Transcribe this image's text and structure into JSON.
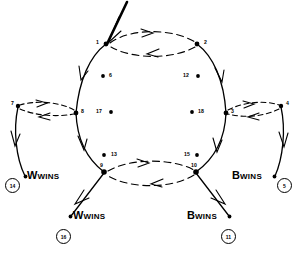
{
  "diagram": {
    "stroke_color": "#000000",
    "background": "#ffffff",
    "main_cycle_nodes": [
      {
        "id": "1",
        "label": "1",
        "x": 106,
        "y": 44
      },
      {
        "id": "2",
        "label": "2",
        "x": 197,
        "y": 44
      },
      {
        "id": "3",
        "label": "3",
        "x": 226,
        "y": 113
      },
      {
        "id": "10",
        "label": "10",
        "x": 196,
        "y": 172
      },
      {
        "id": "9",
        "label": "9",
        "x": 104,
        "y": 172
      },
      {
        "id": "8",
        "label": "8",
        "x": 76,
        "y": 113
      }
    ],
    "branch_nodes": [
      {
        "id": "7",
        "label": "7",
        "x": 18,
        "y": 106
      },
      {
        "id": "4",
        "label": "4",
        "x": 281,
        "y": 106
      }
    ],
    "interior_dots": [
      {
        "id": "6",
        "label": "6",
        "x": 103,
        "y": 76,
        "label_side": "right"
      },
      {
        "id": "12",
        "label": "12",
        "x": 198,
        "y": 76,
        "label_side": "left"
      },
      {
        "id": "17",
        "label": "17",
        "x": 111,
        "y": 112,
        "label_side": "left"
      },
      {
        "id": "18",
        "label": "18",
        "x": 192,
        "y": 112,
        "label_side": "right"
      },
      {
        "id": "13",
        "label": "13",
        "x": 104,
        "y": 155,
        "label_side": "right"
      },
      {
        "id": "15",
        "label": "15",
        "x": 197,
        "y": 155,
        "label_side": "left"
      }
    ],
    "terminals": [
      {
        "id": "t14",
        "winner": "W",
        "wins_text": "WINS",
        "letter": "W",
        "circle_label": "14",
        "label_x": 24,
        "label_y": 169,
        "circle_x": 5,
        "circle_y": 178
      },
      {
        "id": "t5",
        "winner": "B",
        "wins_text": "WINS",
        "letter": "B",
        "circle_label": "5",
        "label_x": 233,
        "label_y": 169,
        "circle_x": 277,
        "circle_y": 178
      },
      {
        "id": "t16",
        "winner": "W",
        "wins_text": "WINS",
        "letter": "W",
        "circle_label": "16",
        "label_x": 71,
        "label_y": 208,
        "circle_x": 56,
        "circle_y": 229
      },
      {
        "id": "t11",
        "winner": "B",
        "wins_text": "WINS",
        "letter": "B",
        "circle_label": "11",
        "label_x": 189,
        "label_y": 208,
        "circle_x": 221,
        "circle_y": 229
      }
    ],
    "edges": [
      {
        "from": "entry",
        "to": "1",
        "style": "thick-solid",
        "description": "entry stem from top"
      },
      {
        "from": "1",
        "to": "2",
        "style": "dashed",
        "description": "upper arc rightward"
      },
      {
        "from": "2",
        "to": "1",
        "style": "dashed",
        "description": "upper arc leftward"
      },
      {
        "from": "1",
        "to": "8",
        "style": "solid",
        "description": "left upper circle arc"
      },
      {
        "from": "2",
        "to": "3",
        "style": "solid",
        "description": "right upper circle arc"
      },
      {
        "from": "8",
        "to": "9",
        "style": "solid",
        "description": "left lower circle arc"
      },
      {
        "from": "3",
        "to": "10",
        "style": "solid",
        "description": "right lower circle arc"
      },
      {
        "from": "9",
        "to": "10",
        "style": "dashed",
        "description": "lower arc rightward"
      },
      {
        "from": "10",
        "to": "9",
        "style": "dashed",
        "description": "lower arc leftward"
      },
      {
        "from": "8",
        "to": "7",
        "style": "dashed",
        "description": "left outward pair upper"
      },
      {
        "from": "7",
        "to": "8",
        "style": "dashed",
        "description": "left outward pair lower"
      },
      {
        "from": "3",
        "to": "4",
        "style": "dashed",
        "description": "right outward pair upper"
      },
      {
        "from": "4",
        "to": "3",
        "style": "dashed",
        "description": "right outward pair lower"
      },
      {
        "from": "7",
        "to": "t14",
        "style": "solid",
        "description": "to W WINS (14)"
      },
      {
        "from": "4",
        "to": "t5",
        "style": "solid",
        "description": "to B WINS (5)"
      },
      {
        "from": "9",
        "to": "t16",
        "style": "solid",
        "description": "to W WINS (16)"
      },
      {
        "from": "10",
        "to": "t11",
        "style": "solid",
        "description": "to B WINS (11)"
      }
    ]
  }
}
